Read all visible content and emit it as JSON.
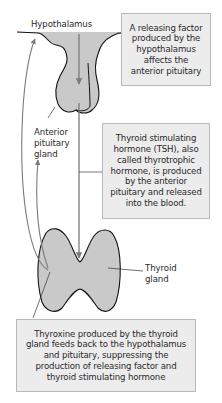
{
  "diagram": {
    "colors": {
      "gland_fill": "#c9c9c9",
      "outline": "#111111",
      "arrow": "#7a7a7a",
      "box_fill": "#ececec",
      "box_border": "#b9b9b9",
      "text": "#2a2a2a"
    },
    "labels": {
      "hypothalamus": "Hypothalamus",
      "anterior_pituitary_line1": "Anterior",
      "anterior_pituitary_line2": "pituitary",
      "anterior_pituitary_line3": "gland",
      "thyroid_line1": "Thyroid",
      "thyroid_line2": "gland"
    },
    "boxes": {
      "releasing_factor": {
        "lines": [
          "A releasing factor",
          "produced by the",
          "hypothalamus",
          "affects the",
          "anterior pituitary"
        ]
      },
      "tsh": {
        "lines": [
          "Thyroid stimulating",
          "hormone (TSH), also",
          "called thyrotrophic",
          "hormone, is produced",
          "by the anterior",
          "pituitary and released",
          "into the blood."
        ]
      },
      "thyroxine": {
        "lines": [
          "Thyroxine produced by the thyroid",
          "gland feeds back to the hypothalamus",
          "and pituitary, suppressing the",
          "production of releasing factor and",
          "thyroid stimulating hormone"
        ]
      }
    }
  }
}
